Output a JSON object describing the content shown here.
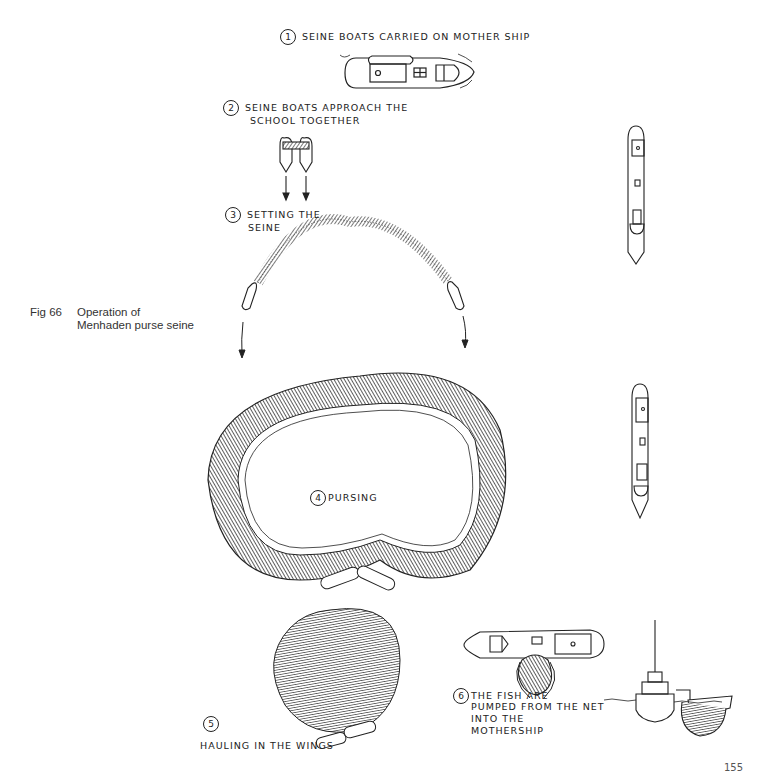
{
  "figure": {
    "number_label": "Fig 66",
    "caption_line1": "Operation of",
    "caption_line2": "Menhaden purse seine"
  },
  "steps": [
    {
      "number": "1",
      "lines": [
        "SEINE BOATS  CARRIED ON MOTHER SHIP"
      ]
    },
    {
      "number": "2",
      "lines": [
        "SEINE BOATS APPROACH THE",
        "SCHOOL TOGETHER"
      ]
    },
    {
      "number": "3",
      "lines": [
        "SETTING THE",
        "SEINE"
      ]
    },
    {
      "number": "4",
      "lines": [
        "PURSING"
      ]
    },
    {
      "number": "5",
      "lines": [
        "HAULING IN THE WINGS"
      ]
    },
    {
      "number": "6",
      "lines": [
        "THE FISH ARE",
        "PUMPED FROM THE NET",
        "INTO THE",
        "MOTHERSHIP"
      ]
    }
  ],
  "page": {
    "number": "155"
  },
  "colors": {
    "ink": "#1a1a1a",
    "net_shade": "#4a4a4a",
    "paper": "#ffffff"
  }
}
